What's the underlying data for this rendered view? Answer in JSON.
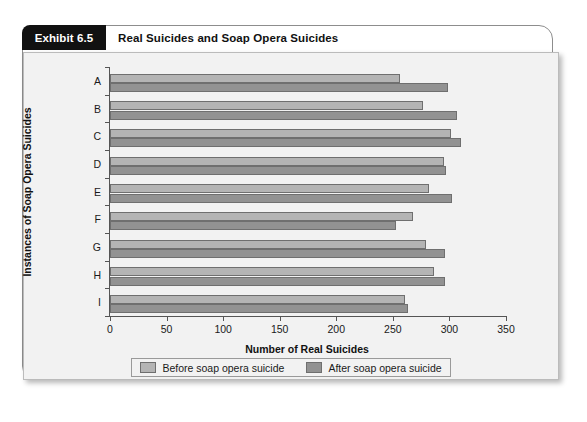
{
  "exhibit": {
    "tag": "Exhibit 6.5",
    "title": "Real Suicides and Soap Opera Suicides"
  },
  "legend": {
    "before_label": "Before soap opera suicide",
    "after_label": "After soap opera suicide"
  },
  "colors": {
    "before_bar": "#b4b4b4",
    "after_bar": "#929292",
    "tag_background": "#111111",
    "panel_background": "#f2f2f2",
    "axis": "#555555"
  },
  "chart_data": {
    "type": "bar",
    "orientation": "horizontal",
    "title": "Real Suicides and Soap Opera Suicides",
    "xlabel": "Number of Real Suicides",
    "ylabel": "Instances of Soap Opera Suicides",
    "xlim": [
      0,
      350
    ],
    "xticks": [
      0,
      50,
      100,
      150,
      200,
      250,
      300,
      350
    ],
    "xtick_labels": [
      "0",
      "50",
      "100",
      "150",
      "200",
      "250",
      "300",
      "350"
    ],
    "categories": [
      "A",
      "B",
      "C",
      "D",
      "E",
      "F",
      "G",
      "H",
      "I"
    ],
    "grid": false,
    "legend_position": "bottom",
    "series": [
      {
        "name": "Before soap opera suicide",
        "values": [
          256,
          277,
          301,
          295,
          282,
          268,
          279,
          286,
          261
        ]
      },
      {
        "name": "After soap opera suicide",
        "values": [
          299,
          307,
          310,
          297,
          302,
          253,
          296,
          296,
          263
        ]
      }
    ]
  }
}
